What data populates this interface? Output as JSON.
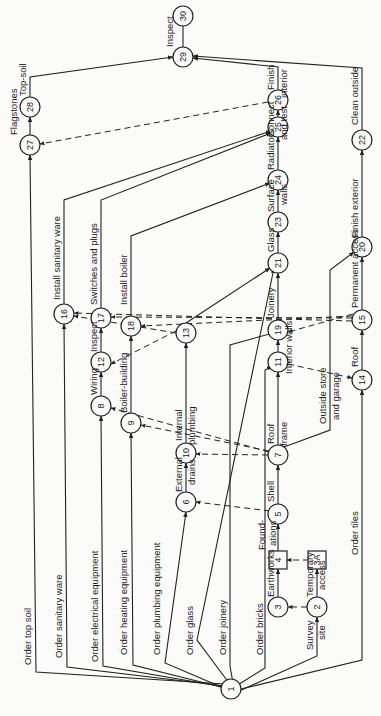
{
  "diagram": {
    "type": "activity-network (arrow diagram), rotated 90° counter-clockwise",
    "nodes": [
      {
        "id": "1",
        "x": 231,
        "y": 689,
        "shape": "circle"
      },
      {
        "id": "2",
        "x": 317,
        "y": 607,
        "shape": "circle"
      },
      {
        "id": "3",
        "x": 278,
        "y": 607,
        "shape": "circle"
      },
      {
        "id": "3A",
        "x": 317,
        "y": 560,
        "shape": "square"
      },
      {
        "id": "4",
        "x": 278,
        "y": 560,
        "shape": "square"
      },
      {
        "id": "5",
        "x": 278,
        "y": 514,
        "shape": "circle"
      },
      {
        "id": "6",
        "x": 186,
        "y": 502,
        "shape": "circle"
      },
      {
        "id": "7",
        "x": 278,
        "y": 455,
        "shape": "circle"
      },
      {
        "id": "8",
        "x": 101,
        "y": 406,
        "shape": "circle"
      },
      {
        "id": "9",
        "x": 131,
        "y": 423,
        "shape": "circle"
      },
      {
        "id": "10",
        "x": 186,
        "y": 453,
        "shape": "circle"
      },
      {
        "id": "11",
        "x": 278,
        "y": 362,
        "shape": "circle"
      },
      {
        "id": "12",
        "x": 101,
        "y": 362,
        "shape": "circle"
      },
      {
        "id": "13",
        "x": 186,
        "y": 333,
        "shape": "circle"
      },
      {
        "id": "14",
        "x": 362,
        "y": 380,
        "shape": "circle"
      },
      {
        "id": "15",
        "x": 362,
        "y": 320,
        "shape": "circle"
      },
      {
        "id": "16",
        "x": 64,
        "y": 314,
        "shape": "circle"
      },
      {
        "id": "17",
        "x": 101,
        "y": 318,
        "shape": "circle"
      },
      {
        "id": "18",
        "x": 131,
        "y": 326,
        "shape": "circle"
      },
      {
        "id": "19",
        "x": 278,
        "y": 330,
        "shape": "circle"
      },
      {
        "id": "20",
        "x": 362,
        "y": 247,
        "shape": "circle"
      },
      {
        "id": "21",
        "x": 278,
        "y": 263,
        "shape": "circle"
      },
      {
        "id": "22",
        "x": 362,
        "y": 140,
        "shape": "circle"
      },
      {
        "id": "23",
        "x": 278,
        "y": 222,
        "shape": "circle"
      },
      {
        "id": "24",
        "x": 278,
        "y": 180,
        "shape": "circle"
      },
      {
        "id": "25",
        "x": 278,
        "y": 127,
        "shape": "circle"
      },
      {
        "id": "26",
        "x": 278,
        "y": 100,
        "shape": "circle"
      },
      {
        "id": "27",
        "x": 30,
        "y": 145,
        "shape": "circle"
      },
      {
        "id": "28",
        "x": 30,
        "y": 107,
        "shape": "circle"
      },
      {
        "id": "29",
        "x": 183,
        "y": 57,
        "shape": "circle"
      },
      {
        "id": "30",
        "x": 183,
        "y": 16,
        "shape": "circle"
      }
    ],
    "activities": [
      {
        "label": "Order top soil",
        "from": "1",
        "to": "27"
      },
      {
        "label": "Order sanitary ware",
        "from": "1",
        "to": "16"
      },
      {
        "label": "Order electrical equipment",
        "from": "1",
        "to": "8"
      },
      {
        "label": "Order heating equipment",
        "from": "1",
        "to": "9"
      },
      {
        "label": "Order plumbing equipment",
        "from": "1",
        "to": "6"
      },
      {
        "label": "Order glass",
        "from": "1",
        "to": "21"
      },
      {
        "label": "Order joinery",
        "from": "1",
        "to": "19"
      },
      {
        "label": "Order bricks",
        "from": "1",
        "to": "11"
      },
      {
        "label": "Order tiles",
        "from": "1",
        "to": "14"
      },
      {
        "label": "Survey site",
        "from": "1",
        "to": "2"
      },
      {
        "label": "Earthworks",
        "from": "3",
        "to": "4"
      },
      {
        "label": "Temporary access",
        "from": "2",
        "to": "3A"
      },
      {
        "label": "Foundations",
        "from": "4",
        "to": "5"
      },
      {
        "label": "Shell",
        "from": "5",
        "to": "7"
      },
      {
        "label": "External drains",
        "from": "6",
        "to": "10"
      },
      {
        "label": "Internal plumbing",
        "from": "10",
        "to": "13"
      },
      {
        "label": "Roof frame",
        "from": "7",
        "to": "11"
      },
      {
        "label": "Interior walls",
        "from": "11",
        "to": "19"
      },
      {
        "label": "Outside store and garage",
        "from": "7",
        "to": "20"
      },
      {
        "label": "Roof",
        "from": "14",
        "to": "15"
      },
      {
        "label": "Permanent access",
        "from": "15",
        "to": "20"
      },
      {
        "label": "Wiring",
        "from": "8",
        "to": "12"
      },
      {
        "label": "Inspect",
        "from": "12",
        "to": "17"
      },
      {
        "label": "Boiler-building",
        "from": "9",
        "to": "18"
      },
      {
        "label": "Install sanitary ware",
        "from": "16",
        "to": "25"
      },
      {
        "label": "Switches and plugs",
        "from": "17",
        "to": "25"
      },
      {
        "label": "Install boiler",
        "from": "18",
        "to": "24"
      },
      {
        "label": "Joinery",
        "from": "19",
        "to": "21"
      },
      {
        "label": "Glass",
        "from": "21",
        "to": "23"
      },
      {
        "label": "Surface walls",
        "from": "23",
        "to": "24"
      },
      {
        "label": "Radiators",
        "from": "24",
        "to": "25"
      },
      {
        "label": "Connect and test",
        "from": "25",
        "to": "26"
      },
      {
        "label": "Finish interior",
        "from": "26",
        "to": "29"
      },
      {
        "label": "Finish exterior",
        "from": "20",
        "to": "22"
      },
      {
        "label": "Clean outside",
        "from": "22",
        "to": "29"
      },
      {
        "label": "Flagstones",
        "from": "27",
        "to": "28"
      },
      {
        "label": "Top-soil",
        "from": "28",
        "to": "29"
      },
      {
        "label": "Inspect",
        "from": "29",
        "to": "30"
      }
    ],
    "dummies": [
      {
        "from": "2",
        "to": "3"
      },
      {
        "from": "3A",
        "to": "4"
      },
      {
        "from": "5",
        "to": "6"
      },
      {
        "from": "7",
        "to": "8"
      },
      {
        "from": "7",
        "to": "9"
      },
      {
        "from": "7",
        "to": "10"
      },
      {
        "from": "11",
        "to": "14"
      },
      {
        "from": "13",
        "to": "12"
      },
      {
        "from": "13",
        "to": "16"
      },
      {
        "from": "15",
        "to": "16"
      },
      {
        "from": "15",
        "to": "17"
      },
      {
        "from": "15",
        "to": "18"
      },
      {
        "from": "15",
        "to": "19"
      },
      {
        "from": "26",
        "to": "27"
      }
    ],
    "text": {
      "order_top_soil": "Order top soil",
      "order_sanitary_ware": "Order sanitary ware",
      "order_electrical": "Order electrical equipment",
      "order_heating": "Order heating equipment",
      "order_plumbing": "Order plumbing equipment",
      "order_glass": "Order glass",
      "order_joinery": "Order joinery",
      "order_bricks": "Order bricks",
      "order_tiles": "Order tiles",
      "survey": "Survey",
      "site": "site",
      "earthworks": "Earthworks",
      "temporary": "Temporary",
      "access": "access",
      "found": "Found-",
      "ations": "ations",
      "shell": "Shell",
      "external": "External",
      "drains": "drains",
      "internal": "Internal",
      "plumbing": "plumbing",
      "roof_a": "Roof",
      "frame": "frame",
      "interior_walls": "Interior walls",
      "outside_store": "Outside store",
      "and_garage": "and garage",
      "roof_b": "Roof",
      "permanent_access": "Permanent access",
      "wiring": "Wiring",
      "inspect_a": "Inspect",
      "boiler_building": "Boiler-building",
      "install_sanitary": "Install sanitary ware",
      "switches_plugs": "Switches and plugs",
      "install_boiler": "Install boiler",
      "joinery": "Joinery",
      "glass": "Glass",
      "surface": "Surface",
      "walls": "walls",
      "radiators": "Radiators",
      "connect": "Connect",
      "and_test": "and test",
      "finish": "Finish",
      "interior": "interior",
      "finish_exterior": "Finish exterior",
      "clean_outside": "Clean outside",
      "flagstones": "Flagstones",
      "top_soil": "Top-soil",
      "inspect_b": "Inspect"
    }
  }
}
